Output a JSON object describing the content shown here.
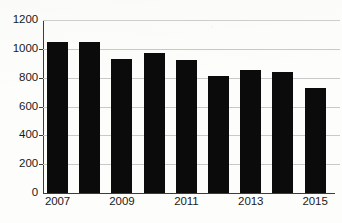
{
  "chart_data": {
    "type": "bar",
    "title": "",
    "subtitle": "",
    "xlabel": "",
    "ylabel": "",
    "categories": [
      "2007",
      "2008",
      "2009",
      "2010",
      "2011",
      "2012",
      "2013",
      "2014",
      "2015"
    ],
    "values": [
      1050,
      1050,
      930,
      970,
      925,
      810,
      850,
      840,
      730
    ],
    "series": [
      {
        "name": "",
        "values": [
          1050,
          1050,
          930,
          970,
          925,
          810,
          850,
          840,
          730
        ]
      }
    ],
    "ylim": [
      0,
      1200
    ],
    "ytick_values": [
      0,
      200,
      400,
      600,
      800,
      1000,
      1200
    ],
    "ytick_labels": [
      "0",
      "200",
      "400",
      "600",
      "800",
      "1000",
      "1200"
    ],
    "xtick_labels": [
      "2007",
      "",
      "2009",
      "",
      "2011",
      "",
      "2013",
      "",
      "2015"
    ],
    "visible_xtick_labels": [
      "2007",
      "2009",
      "2011",
      "2013",
      "2015"
    ],
    "grid": true,
    "grid_axis": "y",
    "legend": false,
    "legend_position": "none",
    "bar_color": "#0b0b0b",
    "grid_color": "#c9c9c9",
    "axis_color": "#3c3c3c",
    "background_color": "#fdfdfc",
    "text_color": "#1a1a1a",
    "annotations": []
  }
}
